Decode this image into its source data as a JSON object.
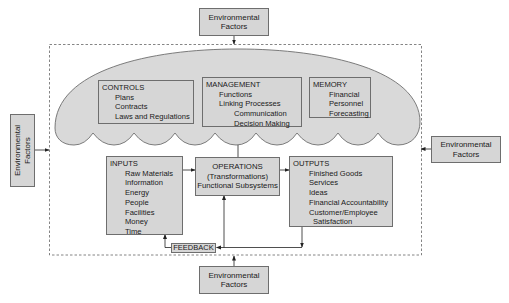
{
  "environment": {
    "top": {
      "line1": "Environmental",
      "line2": "Factors"
    },
    "left": {
      "line1": "Environmental",
      "line2": "Factors"
    },
    "right": {
      "line1": "Environmental",
      "line2": "Factors"
    },
    "bottom": {
      "line1": "Environmental",
      "line2": "Factors"
    }
  },
  "controls": {
    "title": "CONTROLS",
    "items": [
      "Plans",
      "Contracts",
      "Laws and Regulations"
    ]
  },
  "management": {
    "title": "MANAGEMENT",
    "items": [
      "Functions",
      "Linking Processes"
    ],
    "subitems": [
      "Communication",
      "Decision Making"
    ]
  },
  "memory": {
    "title": "MEMORY",
    "items": [
      "Financial",
      "Personnel",
      "Forecasting"
    ]
  },
  "inputs": {
    "title": "INPUTS",
    "items": [
      "Raw Materials",
      "Information",
      "Energy",
      "People",
      "Facilities",
      "Money",
      "Time"
    ]
  },
  "operations": {
    "line1": "OPERATIONS",
    "line2": "(Transformations)",
    "line3": "Functional Subsystems"
  },
  "outputs": {
    "title": "OUTPUTS",
    "items": [
      "Finished Goods",
      "Services",
      "Ideas",
      "Financial Accountability",
      "Customer/Employee"
    ],
    "continuation": "Satisfaction"
  },
  "feedback": {
    "label": "FEEDBACK"
  },
  "colors": {
    "fill": "#d6d6d6",
    "cloud": "#d9d9d9",
    "stroke": "#6e6e6e",
    "line": "#333333"
  }
}
